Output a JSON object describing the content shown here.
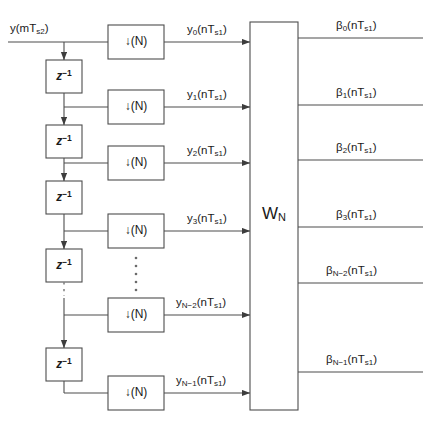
{
  "diagram": {
    "input_signal_label": "y(mT",
    "input_signal_sub": "s2",
    "input_signal_tail": ")",
    "line_color": "#4d4d4d",
    "text_color": "#1a1a1a",
    "background": "#ffffff"
  },
  "input": {
    "name": "y(mT_s2)",
    "base": "y(mT",
    "sub": "s2",
    "tail": ")"
  },
  "transform_block": {
    "label_base": "W",
    "label_sub": "N",
    "name": "W_N"
  },
  "delay_block": {
    "base": "z",
    "sup": "−1",
    "name": "z^-1"
  },
  "downsampler_block": {
    "arrow": "↓",
    "label": "(N)",
    "name": "downsample-by-N"
  },
  "ellipsis": {
    "glyph": "⋮"
  },
  "branches": [
    {
      "index": 0,
      "y": 42,
      "has_delay_above": false,
      "output_base": "y",
      "output_sub": "0",
      "output_tail": "(nT",
      "output_sub2": "s1",
      "output_end": ")",
      "beta_base": "β",
      "beta_sub": "0",
      "beta_tail": "(nT",
      "beta_sub2": "s1",
      "beta_end": ")"
    },
    {
      "index": 1,
      "y": 107,
      "has_delay_above": true,
      "output_base": "y",
      "output_sub": "1",
      "output_tail": "(nT",
      "output_sub2": "s1",
      "output_end": ")",
      "beta_base": "β",
      "beta_sub": "1",
      "beta_tail": "(nT",
      "beta_sub2": "s1",
      "beta_end": ")"
    },
    {
      "index": 2,
      "y": 163,
      "has_delay_above": true,
      "output_base": "y",
      "output_sub": "2",
      "output_tail": "(nT",
      "output_sub2": "s1",
      "output_end": ")",
      "beta_base": "β",
      "beta_sub": "2",
      "beta_tail": "(nT",
      "beta_sub2": "s1",
      "beta_end": ")"
    },
    {
      "index": 3,
      "y": 231,
      "has_delay_above": true,
      "output_base": "y",
      "output_sub": "3",
      "output_tail": "(nT",
      "output_sub2": "s1",
      "output_end": ")",
      "beta_base": "β",
      "beta_sub": "3",
      "beta_tail": "(nT",
      "beta_sub2": "s1",
      "beta_end": ")"
    },
    {
      "index": 4,
      "y": 315,
      "has_delay_above": false,
      "output_base": "y",
      "output_sub": "N−2",
      "output_tail": "(nT",
      "output_sub2": "s1",
      "output_end": ")",
      "beta_base": "β",
      "beta_sub": "N−2",
      "beta_tail": "(nT",
      "beta_sub2": "s1",
      "beta_end": ")"
    },
    {
      "index": 5,
      "y": 393,
      "has_delay_above": true,
      "output_base": "y",
      "output_sub": "N−1",
      "output_tail": "(nT",
      "output_sub2": "s1",
      "output_end": ")",
      "beta_base": "β",
      "beta_sub": "N−1",
      "beta_tail": "(nT",
      "beta_sub2": "s1",
      "beta_end": ")"
    }
  ]
}
